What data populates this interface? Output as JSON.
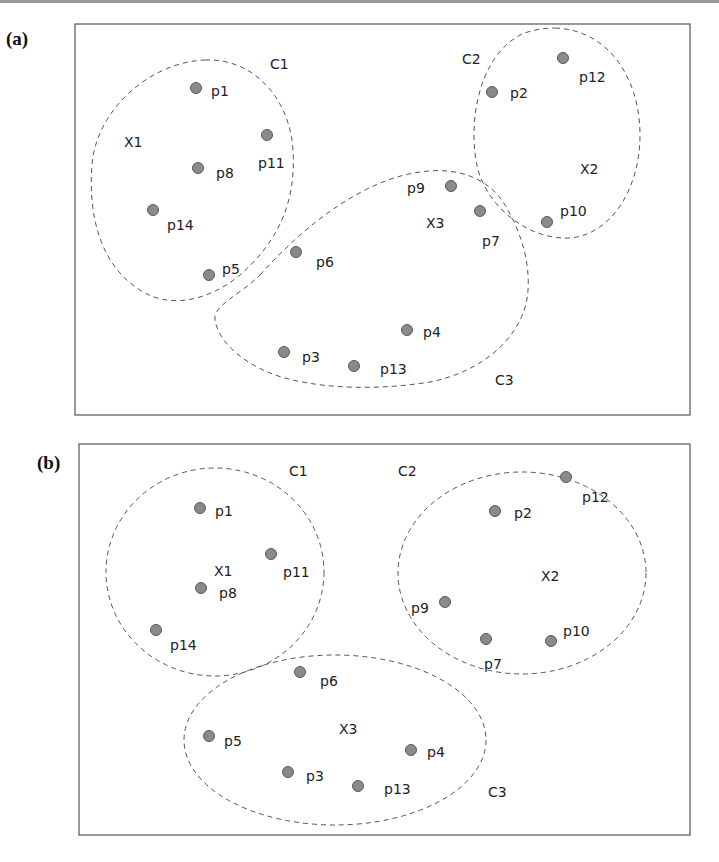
{
  "figure": {
    "panels": [
      {
        "id": "a",
        "label": "(a)",
        "clusters": [
          {
            "name": "C1",
            "center_label": "X1",
            "members": [
              "p1",
              "p8",
              "p11",
              "p14",
              "p5"
            ]
          },
          {
            "name": "C2",
            "center_label": "X2",
            "members": [
              "p2",
              "p12",
              "p10"
            ]
          },
          {
            "name": "C3",
            "center_label": "X3",
            "members": [
              "p9",
              "p7",
              "p6",
              "p4",
              "p3",
              "p13"
            ]
          }
        ],
        "labels": {
          "C1": "C1",
          "C2": "C2",
          "C3": "C3",
          "X1": "X1",
          "X2": "X2",
          "X3": "X3",
          "p1": "p1",
          "p2": "p2",
          "p3": "p3",
          "p4": "p4",
          "p5": "p5",
          "p6": "p6",
          "p7": "p7",
          "p8": "p8",
          "p9": "p9",
          "p10": "p10",
          "p11": "p11",
          "p12": "p12",
          "p13": "p13",
          "p14": "p14"
        }
      },
      {
        "id": "b",
        "label": "(b)",
        "clusters": [
          {
            "name": "C1",
            "center_label": "X1",
            "members": [
              "p1",
              "p8",
              "p11",
              "p14"
            ]
          },
          {
            "name": "C2",
            "center_label": "X2",
            "members": [
              "p2",
              "p12",
              "p9",
              "p7",
              "p10"
            ]
          },
          {
            "name": "C3",
            "center_label": "X3",
            "members": [
              "p6",
              "p5",
              "p3",
              "p13",
              "p4"
            ]
          }
        ],
        "labels": {
          "C1": "C1",
          "C2": "C2",
          "C3": "C3",
          "X1": "X1",
          "X2": "X2",
          "X3": "X3",
          "p1": "p1",
          "p2": "p2",
          "p3": "p3",
          "p4": "p4",
          "p5": "p5",
          "p6": "p6",
          "p7": "p7",
          "p8": "p8",
          "p9": "p9",
          "p10": "p10",
          "p11": "p11",
          "p12": "p12",
          "p13": "p13",
          "p14": "p14"
        }
      }
    ],
    "colors": {
      "point_fill": "#8a8a8a",
      "point_stroke": "#5a5a5a",
      "border": "#555555",
      "text": "#222222"
    }
  }
}
